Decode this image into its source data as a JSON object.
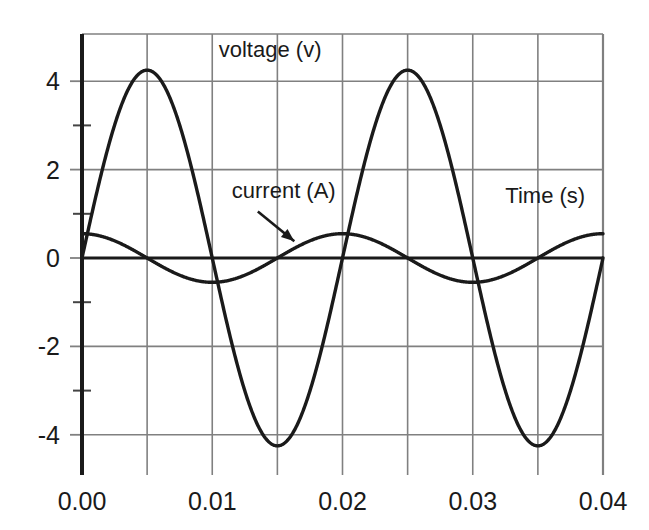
{
  "chart_data": {
    "type": "line",
    "title": "",
    "xlabel": "Time (s)",
    "ylabel": "",
    "xlim": [
      0.0,
      0.04
    ],
    "ylim": [
      -4.8,
      4.8
    ],
    "grid": true,
    "grid_x_step": 0.005,
    "grid_y_step": 2,
    "minor_y_ticks": [
      3,
      1,
      -1,
      -3
    ],
    "legend_position": "inline-annotations",
    "x_tick_labels": [
      "0.00",
      "0.01",
      "0.02",
      "0.03",
      "0.04"
    ],
    "x_tick_values": [
      0.0,
      0.01,
      0.02,
      0.03,
      0.04
    ],
    "y_tick_labels": [
      "4",
      "2",
      "0",
      "-2",
      "-4"
    ],
    "y_tick_values": [
      4,
      2,
      0,
      -2,
      -4
    ],
    "series": [
      {
        "name": "voltage (v)",
        "unit": "v",
        "waveform": "sine",
        "amplitude": 4.25,
        "period": 0.02,
        "frequency_hz": 50,
        "phase_deg": 0,
        "values_at_ticks": [
          0,
          4.25,
          0,
          -4.25,
          0,
          4.25,
          0,
          -4.25,
          0
        ],
        "sample_times": [
          0.0,
          0.005,
          0.01,
          0.015,
          0.02,
          0.025,
          0.03,
          0.035,
          0.04
        ]
      },
      {
        "name": "current (A)",
        "unit": "A",
        "waveform": "cosine",
        "amplitude": 0.55,
        "period": 0.02,
        "frequency_hz": 50,
        "phase_deg": 90,
        "values_at_ticks": [
          0.55,
          0,
          -0.55,
          0,
          0.55,
          0,
          -0.55,
          0,
          0.55
        ],
        "sample_times": [
          0.0,
          0.005,
          0.01,
          0.015,
          0.02,
          0.025,
          0.03,
          0.035,
          0.04
        ]
      }
    ],
    "annotations": [
      {
        "text": "voltage (v)",
        "x": 0.0105,
        "y": 4.55,
        "has_arrow": false
      },
      {
        "text": "current (A)",
        "x": 0.0115,
        "y": 1.35,
        "has_arrow": true,
        "arrow_from": {
          "x": 0.0135,
          "y": 1.05
        },
        "arrow_to": {
          "x": 0.0163,
          "y": 0.38
        }
      },
      {
        "text": "Time (s)",
        "x": 0.0325,
        "y": 1.25,
        "has_arrow": false
      }
    ],
    "colors": {
      "curve": "#1a1a1a",
      "grid": "#808080",
      "axis": "#1a1a1a",
      "background": "#ffffff",
      "text": "#1a1a1a"
    }
  }
}
